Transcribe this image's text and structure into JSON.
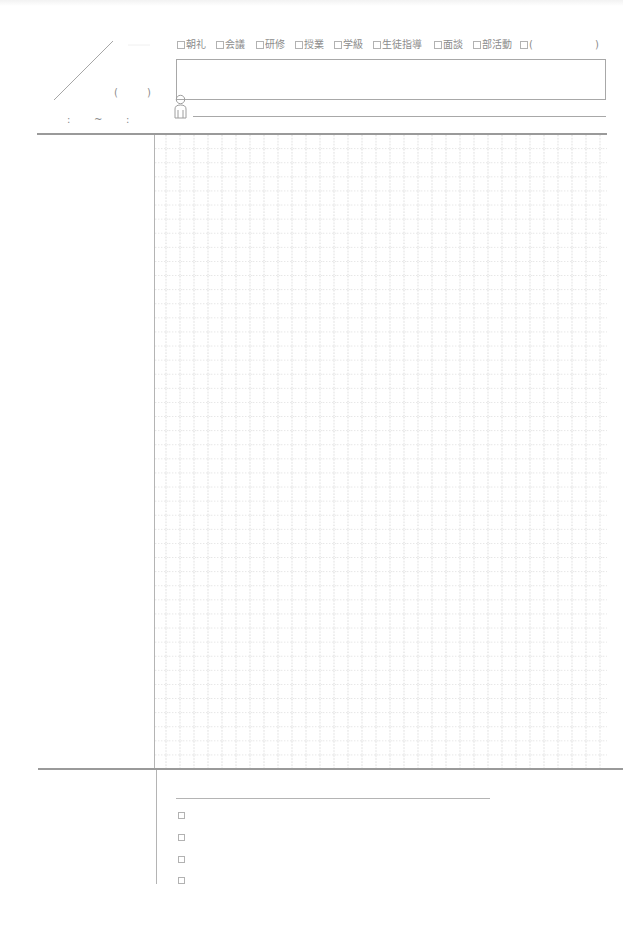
{
  "header": {
    "date": {
      "weekday_open": "(",
      "weekday_close": ")"
    },
    "time": {
      "start_separator": ":",
      "range_separator": "~",
      "end_separator": ":"
    },
    "categories": [
      {
        "label": "朝礼",
        "checked": false
      },
      {
        "label": "会議",
        "checked": false
      },
      {
        "label": "研修",
        "checked": false
      },
      {
        "label": "授業",
        "checked": false
      },
      {
        "label": "学級",
        "checked": false
      },
      {
        "label": "生徒指導",
        "checked": false
      },
      {
        "label": "面談",
        "checked": false
      },
      {
        "label": "部活動",
        "checked": false
      },
      {
        "label": "(",
        "checked": false,
        "close": ")"
      }
    ],
    "title_field": {
      "value": "",
      "placeholder": ""
    },
    "attendees": {
      "icon": "person-icon",
      "value": "",
      "placeholder": ""
    }
  },
  "notes": {
    "left_column_text": "",
    "grid": {
      "cell_size_px": 14,
      "style": "dotted"
    }
  },
  "action_items": {
    "items": [
      {
        "checked": false,
        "text": ""
      },
      {
        "checked": false,
        "text": ""
      },
      {
        "checked": false,
        "text": ""
      },
      {
        "checked": false,
        "text": ""
      }
    ]
  },
  "colors": {
    "line": "#b4b4b4",
    "divider": "#9a9a9a",
    "grid": "#d4d4d4",
    "text": "#8c8c8c"
  }
}
